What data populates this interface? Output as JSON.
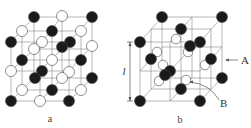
{
  "figure_a": {
    "caption": "a",
    "lines": [
      [
        11,
        42,
        34,
        17
      ],
      [
        34,
        17,
        92,
        17
      ],
      [
        92,
        17,
        69,
        42
      ],
      [
        11,
        42,
        69,
        42
      ],
      [
        11,
        42,
        11,
        101
      ],
      [
        69,
        42,
        69,
        101
      ],
      [
        92,
        17,
        92,
        78
      ],
      [
        11,
        101,
        69,
        101
      ],
      [
        69,
        101,
        92,
        78
      ],
      [
        22,
        31,
        81,
        31
      ],
      [
        62,
        16,
        42,
        42
      ],
      [
        62,
        46,
        62,
        46
      ],
      [
        11,
        71,
        69,
        71
      ],
      [
        69,
        71,
        92,
        46
      ],
      [
        22,
        60,
        81,
        60
      ],
      [
        22,
        90,
        81,
        90
      ],
      [
        40,
        42,
        40,
        101
      ],
      [
        22,
        31,
        22,
        90
      ],
      [
        81,
        31,
        81,
        90
      ],
      [
        52,
        31,
        52,
        90
      ],
      [
        34,
        17,
        34,
        78
      ],
      [
        62,
        16,
        62,
        78
      ],
      [
        11,
        101,
        34,
        78
      ],
      [
        40,
        101,
        62,
        78
      ],
      [
        34,
        78,
        92,
        78
      ],
      [
        11,
        71,
        34,
        49
      ],
      [
        40,
        71,
        62,
        49
      ],
      [
        34,
        49,
        92,
        49
      ]
    ],
    "circles": [
      {
        "x": 34,
        "y": 17,
        "c": "black"
      },
      {
        "x": 62,
        "y": 16,
        "c": "white"
      },
      {
        "x": 92,
        "y": 17,
        "c": "black"
      },
      {
        "x": 22,
        "y": 31,
        "c": "white"
      },
      {
        "x": 52,
        "y": 31,
        "c": "black"
      },
      {
        "x": 81,
        "y": 31,
        "c": "white"
      },
      {
        "x": 11,
        "y": 42,
        "c": "black"
      },
      {
        "x": 42,
        "y": 42,
        "c": "white"
      },
      {
        "x": 34,
        "y": 49,
        "c": "white"
      },
      {
        "x": 70,
        "y": 42,
        "c": "black"
      },
      {
        "x": 62,
        "y": 47,
        "c": "black"
      },
      {
        "x": 92,
        "y": 46,
        "c": "white"
      },
      {
        "x": 22,
        "y": 60,
        "c": "black"
      },
      {
        "x": 52,
        "y": 60,
        "c": "white"
      },
      {
        "x": 81,
        "y": 60,
        "c": "black"
      },
      {
        "x": 11,
        "y": 71,
        "c": "white"
      },
      {
        "x": 42,
        "y": 71,
        "c": "black"
      },
      {
        "x": 35,
        "y": 78,
        "c": "black"
      },
      {
        "x": 62,
        "y": 78,
        "c": "white"
      },
      {
        "x": 69,
        "y": 72,
        "c": "white"
      },
      {
        "x": 92,
        "y": 78,
        "c": "black"
      },
      {
        "x": 22,
        "y": 90,
        "c": "white"
      },
      {
        "x": 52,
        "y": 90,
        "c": "black"
      },
      {
        "x": 81,
        "y": 90,
        "c": "white"
      },
      {
        "x": 11,
        "y": 101,
        "c": "black"
      },
      {
        "x": 40,
        "y": 101,
        "c": "white"
      },
      {
        "x": 69,
        "y": 101,
        "c": "black"
      }
    ]
  },
  "figure_b": {
    "caption": "b",
    "label_A": "A",
    "label_B": "B",
    "label_l": "l",
    "lines": [
      [
        140,
        42,
        162,
        17
      ],
      [
        162,
        17,
        222,
        17
      ],
      [
        222,
        17,
        200,
        42
      ],
      [
        140,
        42,
        200,
        42
      ],
      [
        140,
        42,
        140,
        101
      ],
      [
        200,
        42,
        200,
        101
      ],
      [
        222,
        17,
        222,
        78
      ],
      [
        140,
        101,
        200,
        101
      ],
      [
        200,
        101,
        222,
        78
      ],
      [
        170,
        42,
        170,
        101
      ],
      [
        140,
        71,
        200,
        71
      ],
      [
        200,
        71,
        222,
        47
      ],
      [
        170,
        42,
        192,
        17
      ],
      [
        151,
        29,
        211,
        29
      ],
      [
        192,
        17,
        192,
        78
      ],
      [
        162,
        17,
        162,
        78
      ],
      [
        162,
        78,
        222,
        78
      ],
      [
        140,
        101,
        162,
        78
      ],
      [
        170,
        101,
        192,
        78
      ],
      [
        151,
        29,
        151,
        89
      ],
      [
        211,
        29,
        211,
        89
      ],
      [
        151,
        89,
        211,
        89
      ],
      [
        162,
        47,
        222,
        47
      ],
      [
        140,
        71,
        162,
        47
      ],
      [
        170,
        71,
        192,
        47
      ],
      [
        181,
        29,
        181,
        89
      ]
    ],
    "black": [
      {
        "x": 162,
        "y": 17
      },
      {
        "x": 222,
        "y": 17
      },
      {
        "x": 181,
        "y": 29
      },
      {
        "x": 140,
        "y": 42
      },
      {
        "x": 200,
        "y": 42
      },
      {
        "x": 190,
        "y": 46
      },
      {
        "x": 151,
        "y": 59
      },
      {
        "x": 211,
        "y": 59
      },
      {
        "x": 170,
        "y": 71
      },
      {
        "x": 165,
        "y": 75
      },
      {
        "x": 222,
        "y": 78
      },
      {
        "x": 181,
        "y": 89
      },
      {
        "x": 140,
        "y": 101
      },
      {
        "x": 200,
        "y": 101
      }
    ],
    "white": [
      {
        "x": 176,
        "y": 39
      },
      {
        "x": 157,
        "y": 52
      },
      {
        "x": 188,
        "y": 52
      },
      {
        "x": 205,
        "y": 65
      },
      {
        "x": 163,
        "y": 65
      },
      {
        "x": 159,
        "y": 81
      },
      {
        "x": 186,
        "y": 80
      }
    ],
    "dimension": {
      "x": 130,
      "y1": 42,
      "y2": 101
    }
  }
}
